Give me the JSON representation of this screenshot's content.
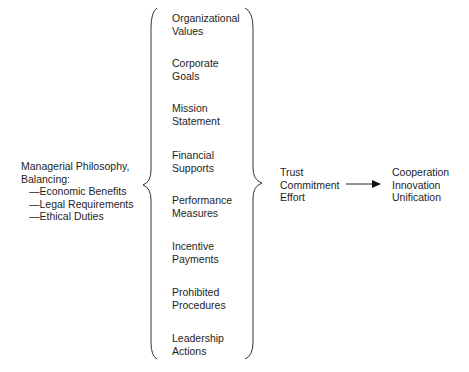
{
  "philosophy": {
    "title_line1": "Managerial Philosophy,",
    "title_line2": "Balancing:",
    "items": [
      "—Economic Benefits",
      "—Legal Requirements",
      "—Ethical Duties"
    ]
  },
  "components": [
    {
      "line1": "Organizational",
      "line2": "Values"
    },
    {
      "line1": "Corporate",
      "line2": "Goals"
    },
    {
      "line1": "Mission",
      "line2": "Statement"
    },
    {
      "line1": "Financial",
      "line2": "Supports"
    },
    {
      "line1": "Performance",
      "line2": "Measures"
    },
    {
      "line1": "Incentive",
      "line2": "Payments"
    },
    {
      "line1": "Prohibited",
      "line2": "Procedures"
    },
    {
      "line1": "Leadership",
      "line2": "Actions"
    }
  ],
  "intermediate": {
    "items": [
      "Trust",
      "Commitment",
      "Effort"
    ]
  },
  "outcomes": {
    "items": [
      "Cooperation",
      "Innovation",
      "Unification"
    ]
  },
  "colors": {
    "text": "#1e1e1e",
    "line": "#333333",
    "background": "#ffffff"
  }
}
